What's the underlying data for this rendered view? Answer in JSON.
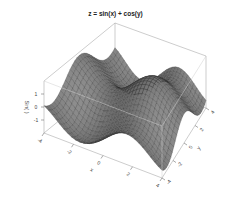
{
  "chart_data": {
    "type": "surface3d",
    "title": "z = sin(x) + cos(y)",
    "function": "sin(x) + cos(y)",
    "xlabel": "x",
    "ylabel": "y",
    "zlabel": "Sin( )",
    "xlim": [
      -4,
      4
    ],
    "ylim": [
      -4,
      4
    ],
    "zlim": [
      -2,
      2
    ],
    "x_ticks": [
      -4,
      -2,
      0,
      2,
      4
    ],
    "y_ticks": [
      -4,
      -2,
      0,
      2,
      4
    ],
    "z_ticks": [
      -1,
      0,
      1
    ],
    "grid_resolution": 30,
    "surface_color": "#6e6e6e",
    "mesh_color": "#2a2a2a",
    "box_color": "#9a9a9a",
    "view": {
      "theta": 30,
      "phi": 30
    }
  }
}
